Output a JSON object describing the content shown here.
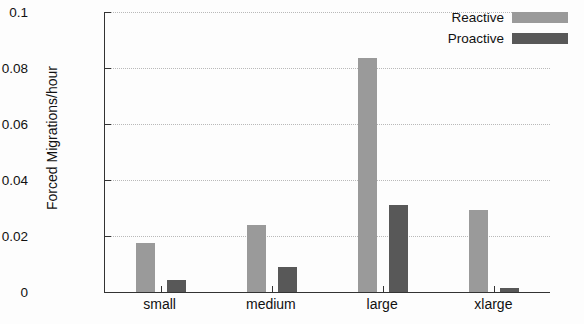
{
  "chart_data": {
    "type": "bar",
    "title": "",
    "xlabel": "",
    "ylabel": "Forced Migrations/hour",
    "categories": [
      "small",
      "medium",
      "large",
      "xlarge"
    ],
    "series": [
      {
        "name": "Reactive",
        "color": "#9a9a9a",
        "values": [
          0.0175,
          0.0238,
          0.0835,
          0.0293
        ]
      },
      {
        "name": "Proactive",
        "color": "#585858",
        "values": [
          0.0043,
          0.0088,
          0.031,
          0.0015
        ]
      }
    ],
    "ylim": [
      0,
      0.1
    ],
    "yticks": [
      0,
      0.02,
      0.04,
      0.06,
      0.08,
      0.1
    ],
    "ytick_labels": [
      "0",
      "0.02",
      "0.04",
      "0.06",
      "0.08",
      "0.1"
    ],
    "grid": true,
    "grid_style": "dotted-horizontal",
    "legend_position": "top-right",
    "legend": [
      "Reactive",
      "Proactive"
    ]
  }
}
